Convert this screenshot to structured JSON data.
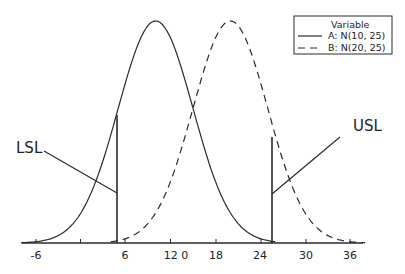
{
  "chart_data": {
    "type": "line",
    "title": "",
    "xlabel": "",
    "ylabel": "",
    "x_ticks": [
      -6,
      0,
      6,
      12,
      18,
      24,
      30,
      36
    ],
    "x_tick_labels": [
      "-6",
      "",
      "6",
      "12 0",
      "18",
      "24",
      "30",
      "36"
    ],
    "xlim": [
      -8,
      38
    ],
    "grid": false,
    "legend": {
      "position": "top-right",
      "title": "Variable",
      "entries": [
        {
          "label": "A: N(10, 25)",
          "style": "solid"
        },
        {
          "label": "B: N(20, 25)",
          "style": "dashed"
        }
      ]
    },
    "series": [
      {
        "name": "A: N(10, 25)",
        "distribution": "normal",
        "mean": 10,
        "variance": 25,
        "style": "solid"
      },
      {
        "name": "B: N(20, 25)",
        "distribution": "normal",
        "mean": 20,
        "variance": 25,
        "style": "dashed"
      }
    ],
    "annotations": [
      {
        "text": "LSL",
        "x": 4.6,
        "kind": "vertical-limit"
      },
      {
        "text": "USL",
        "x": 25.6,
        "kind": "vertical-limit"
      }
    ]
  },
  "labels": {
    "lsl": "LSL",
    "usl": "USL",
    "legend_title": "Variable",
    "legend_a": "A: N(10, 25)",
    "legend_b": "B: N(20, 25)",
    "ticks": [
      "-6",
      "6",
      "12 0",
      "18",
      "24",
      "30",
      "36"
    ]
  },
  "colors": {
    "line": "#2a2a2a",
    "background": "#ffffff"
  }
}
